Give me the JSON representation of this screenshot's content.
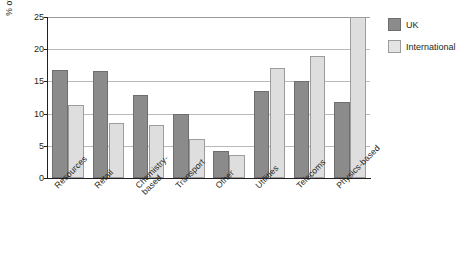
{
  "chart_data": {
    "type": "bar",
    "title": "",
    "xlabel": "",
    "ylabel": "% of total capital expenditure",
    "ylim": [
      0,
      25
    ],
    "yticks": [
      0,
      5,
      10,
      15,
      20,
      25
    ],
    "grid": true,
    "legend_position": "right",
    "categories": [
      "Resources",
      "Retail",
      "Chemistry-\nbased",
      "Transport",
      "Other",
      "Utilities",
      "Telecoms",
      "Physics-based"
    ],
    "series": [
      {
        "name": "UK",
        "color": "#8b8b8b",
        "values": [
          16.7,
          16.6,
          12.9,
          10.0,
          4.2,
          13.5,
          15.0,
          11.8
        ]
      },
      {
        "name": "International",
        "color": "#dedede",
        "values": [
          11.4,
          8.6,
          8.3,
          6.1,
          3.5,
          17.1,
          19.0,
          25.0
        ]
      }
    ]
  },
  "legend": {
    "items": [
      {
        "label": "UK"
      },
      {
        "label": "International"
      }
    ]
  }
}
